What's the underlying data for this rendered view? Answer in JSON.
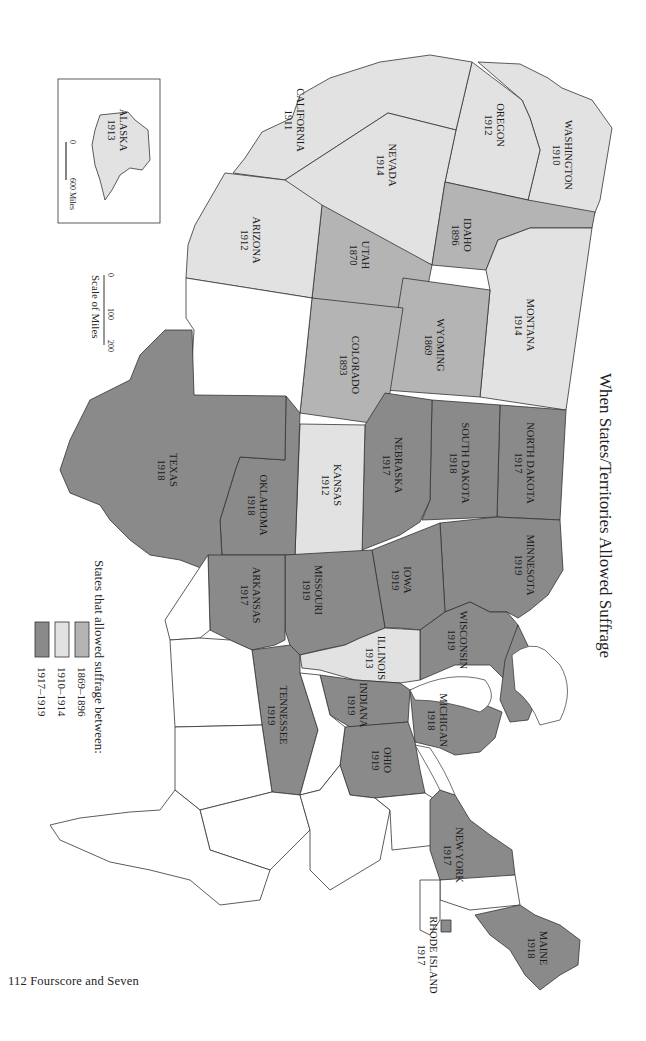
{
  "title": "When States/Territories Allowed Suffrage",
  "footer": "112  Fourscore and Seven",
  "legend": {
    "heading": "States that allowed suffrage between:",
    "items": [
      {
        "label": "1869–1896",
        "color": "#b4b4b4"
      },
      {
        "label": "1910–1914",
        "color": "#e2e2e2"
      },
      {
        "label": "1917–1919",
        "color": "#8a8a8a"
      }
    ]
  },
  "scale": {
    "label": "Scale of Miles",
    "ticks": [
      "0",
      "100",
      "200"
    ]
  },
  "inset": {
    "state": "ALASKA",
    "year": "1913",
    "scale_ticks": [
      "0",
      "600 Miles"
    ]
  },
  "colors": {
    "early": "#b4b4b4",
    "mid": "#e2e2e2",
    "late": "#8a8a8a",
    "none": "#ffffff",
    "stroke": "#333333"
  },
  "states": [
    {
      "name": "WASHINGTON",
      "year": "1910",
      "period": "mid"
    },
    {
      "name": "OREGON",
      "year": "1912",
      "period": "mid"
    },
    {
      "name": "CALIFORNIA",
      "year": "1911",
      "period": "mid"
    },
    {
      "name": "NEVADA",
      "year": "1914",
      "period": "mid"
    },
    {
      "name": "IDAHO",
      "year": "1896",
      "period": "early"
    },
    {
      "name": "UTAH",
      "year": "1870",
      "period": "early"
    },
    {
      "name": "ARIZONA",
      "year": "1912",
      "period": "mid"
    },
    {
      "name": "MONTANA",
      "year": "1914",
      "period": "mid"
    },
    {
      "name": "WYOMING",
      "year": "1869",
      "period": "early"
    },
    {
      "name": "COLORADO",
      "year": "1893",
      "period": "early"
    },
    {
      "name": "NORTH DAKOTA",
      "year": "1917",
      "period": "late"
    },
    {
      "name": "SOUTH DAKOTA",
      "year": "1918",
      "period": "late"
    },
    {
      "name": "NEBRASKA",
      "year": "1917",
      "period": "late"
    },
    {
      "name": "KANSAS",
      "year": "1912",
      "period": "mid"
    },
    {
      "name": "OKLAHOMA",
      "year": "1918",
      "period": "late"
    },
    {
      "name": "TEXAS",
      "year": "1918",
      "period": "late"
    },
    {
      "name": "MINNESOTA",
      "year": "1919",
      "period": "late"
    },
    {
      "name": "IOWA",
      "year": "1919",
      "period": "late"
    },
    {
      "name": "MISSOURI",
      "year": "1919",
      "period": "late"
    },
    {
      "name": "ARKANSAS",
      "year": "1917",
      "period": "late"
    },
    {
      "name": "WISCONSIN",
      "year": "1919",
      "period": "late"
    },
    {
      "name": "ILLINOIS",
      "year": "1913",
      "period": "mid"
    },
    {
      "name": "MICHIGAN",
      "year": "1918",
      "period": "late"
    },
    {
      "name": "INDIANA",
      "year": "1919",
      "period": "late"
    },
    {
      "name": "OHIO",
      "year": "1919",
      "period": "late"
    },
    {
      "name": "TENNESSEE",
      "year": "1919",
      "period": "late"
    },
    {
      "name": "NEW YORK",
      "year": "1917",
      "period": "late"
    },
    {
      "name": "RHODE ISLAND",
      "year": "1917",
      "period": "late"
    },
    {
      "name": "MAINE",
      "year": "1918",
      "period": "late"
    }
  ]
}
